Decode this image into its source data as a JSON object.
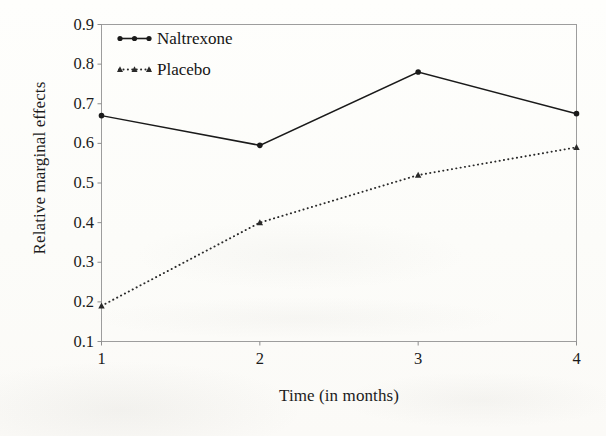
{
  "chart_data": {
    "type": "line",
    "title": "",
    "xlabel": "Time (in months)",
    "ylabel": "Relative marginal effects",
    "x": [
      1,
      2,
      3,
      4
    ],
    "xtick_labels": [
      "1",
      "2",
      "3",
      "4"
    ],
    "ytick_labels": [
      "0.1",
      "0.2",
      "0.3",
      "0.4",
      "0.5",
      "0.6",
      "0.7",
      "0.8",
      "0.9"
    ],
    "ytick_values": [
      0.1,
      0.2,
      0.3,
      0.4,
      0.5,
      0.6,
      0.7,
      0.8,
      0.9
    ],
    "xlim": [
      1,
      4
    ],
    "ylim": [
      0.1,
      0.9
    ],
    "grid": false,
    "legend_position": "upper-left-inside",
    "series": [
      {
        "name": "Naltrexone",
        "values": [
          0.67,
          0.595,
          0.78,
          0.675
        ],
        "line_style": "solid",
        "marker": "circle",
        "color": "#1a1a1a"
      },
      {
        "name": "Placebo",
        "values": [
          0.19,
          0.4,
          0.52,
          0.59
        ],
        "line_style": "dotted",
        "marker": "triangle",
        "color": "#2a2a2a"
      }
    ]
  },
  "figure": {
    "frame_color": "#9a9a9a",
    "axis_color": "#8d8d8d",
    "background": "#fdfdfb",
    "text_color": "#1b1b1b"
  }
}
